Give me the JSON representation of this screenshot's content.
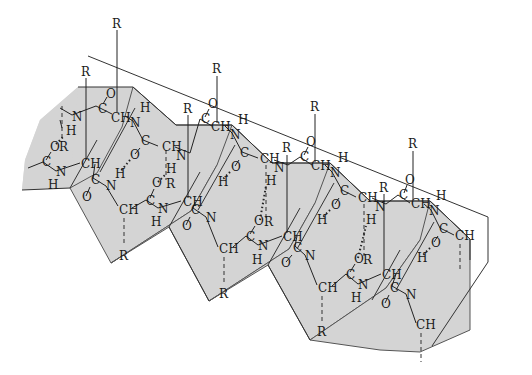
{
  "diagram": {
    "type": "beta-pleated-sheet",
    "colors": {
      "sheet_fill": "#d4d4d4",
      "line": "#333333",
      "background": "#ffffff"
    },
    "side_chains": [
      {
        "label": "R",
        "x": 117,
        "y": 25
      },
      {
        "label": "R",
        "x": 86,
        "y": 74
      },
      {
        "label": "R",
        "x": 217,
        "y": 70
      },
      {
        "label": "R",
        "x": 188,
        "y": 110
      },
      {
        "label": "R",
        "x": 315,
        "y": 108
      },
      {
        "label": "R",
        "x": 287,
        "y": 150
      },
      {
        "label": "R",
        "x": 413,
        "y": 146
      },
      {
        "label": "R",
        "x": 384,
        "y": 189
      },
      {
        "label": "R",
        "x": 124,
        "y": 258
      },
      {
        "label": "R",
        "x": 224,
        "y": 296
      },
      {
        "label": "R",
        "x": 322,
        "y": 334
      },
      {
        "label": "R",
        "x": 59,
        "y": 147
      },
      {
        "label": "R",
        "x": 167,
        "y": 185
      },
      {
        "label": "R",
        "x": 266,
        "y": 223
      },
      {
        "label": "R",
        "x": 365,
        "y": 262
      }
    ],
    "atoms": [
      {
        "label": "N",
        "x": 72,
        "y": 117
      },
      {
        "label": "C",
        "x": 100,
        "y": 109
      },
      {
        "label": "O",
        "x": 107,
        "y": 94
      },
      {
        "label": "CH",
        "x": 113,
        "y": 118
      },
      {
        "label": "H",
        "x": 141,
        "y": 110
      },
      {
        "label": "N",
        "x": 133,
        "y": 125
      },
      {
        "label": "H",
        "x": 68,
        "y": 133
      },
      {
        "label": "O",
        "x": 52,
        "y": 149
      },
      {
        "label": "C",
        "x": 44,
        "y": 164
      },
      {
        "label": "N",
        "x": 58,
        "y": 174
      },
      {
        "label": "H",
        "x": 50,
        "y": 187
      },
      {
        "label": "CH",
        "x": 83,
        "y": 166
      },
      {
        "label": "C",
        "x": 143,
        "y": 143
      },
      {
        "label": "O",
        "x": 132,
        "y": 157
      },
      {
        "label": "CH",
        "x": 163,
        "y": 149
      },
      {
        "label": "H",
        "x": 168,
        "y": 171
      },
      {
        "label": "N",
        "x": 178,
        "y": 158
      },
      {
        "label": "H",
        "x": 117,
        "y": 176
      },
      {
        "label": "C",
        "x": 93,
        "y": 182
      },
      {
        "label": "N",
        "x": 108,
        "y": 188
      },
      {
        "label": "O",
        "x": 84,
        "y": 199
      },
      {
        "label": "CH",
        "x": 120,
        "y": 212
      },
      {
        "label": "C",
        "x": 148,
        "y": 203
      },
      {
        "label": "O",
        "x": 154,
        "y": 185
      },
      {
        "label": "N",
        "x": 160,
        "y": 211
      },
      {
        "label": "H",
        "x": 153,
        "y": 224
      },
      {
        "label": "CH",
        "x": 184,
        "y": 204
      },
      {
        "label": "C",
        "x": 203,
        "y": 121
      },
      {
        "label": "O",
        "x": 210,
        "y": 106
      },
      {
        "label": "CH",
        "x": 213,
        "y": 129
      },
      {
        "label": "H",
        "x": 240,
        "y": 122
      },
      {
        "label": "N",
        "x": 232,
        "y": 137
      },
      {
        "label": "C",
        "x": 242,
        "y": 155
      },
      {
        "label": "O",
        "x": 233,
        "y": 169
      },
      {
        "label": "CH",
        "x": 262,
        "y": 161
      },
      {
        "label": "N",
        "x": 276,
        "y": 170
      },
      {
        "label": "H",
        "x": 268,
        "y": 183
      },
      {
        "label": "H",
        "x": 220,
        "y": 184
      },
      {
        "label": "C",
        "x": 193,
        "y": 212
      },
      {
        "label": "O",
        "x": 184,
        "y": 228
      },
      {
        "label": "N",
        "x": 208,
        "y": 220
      },
      {
        "label": "CH",
        "x": 221,
        "y": 251
      },
      {
        "label": "O",
        "x": 256,
        "y": 223
      },
      {
        "label": "C",
        "x": 248,
        "y": 239
      },
      {
        "label": "N",
        "x": 260,
        "y": 248
      },
      {
        "label": "H",
        "x": 254,
        "y": 262
      },
      {
        "label": "CH",
        "x": 285,
        "y": 239
      },
      {
        "label": "C",
        "x": 302,
        "y": 159
      },
      {
        "label": "O",
        "x": 308,
        "y": 144
      },
      {
        "label": "CH",
        "x": 313,
        "y": 168
      },
      {
        "label": "H",
        "x": 340,
        "y": 160
      },
      {
        "label": "N",
        "x": 332,
        "y": 175
      },
      {
        "label": "C",
        "x": 342,
        "y": 193
      },
      {
        "label": "O",
        "x": 333,
        "y": 207
      },
      {
        "label": "CH",
        "x": 360,
        "y": 200
      },
      {
        "label": "N",
        "x": 377,
        "y": 209
      },
      {
        "label": "H",
        "x": 368,
        "y": 222
      },
      {
        "label": "H",
        "x": 319,
        "y": 222
      },
      {
        "label": "C",
        "x": 295,
        "y": 250
      },
      {
        "label": "O",
        "x": 283,
        "y": 265
      },
      {
        "label": "N",
        "x": 307,
        "y": 258
      },
      {
        "label": "CH",
        "x": 320,
        "y": 290
      },
      {
        "label": "O",
        "x": 356,
        "y": 261
      },
      {
        "label": "C",
        "x": 348,
        "y": 277
      },
      {
        "label": "N",
        "x": 360,
        "y": 287
      },
      {
        "label": "H",
        "x": 353,
        "y": 300
      },
      {
        "label": "CH",
        "x": 384,
        "y": 277
      },
      {
        "label": "C",
        "x": 401,
        "y": 197
      },
      {
        "label": "O",
        "x": 407,
        "y": 182
      },
      {
        "label": "CH",
        "x": 413,
        "y": 206
      },
      {
        "label": "H",
        "x": 438,
        "y": 198
      },
      {
        "label": "N",
        "x": 431,
        "y": 213
      },
      {
        "label": "C",
        "x": 441,
        "y": 231
      },
      {
        "label": "O",
        "x": 433,
        "y": 245
      },
      {
        "label": "CH",
        "x": 457,
        "y": 238
      },
      {
        "label": "H",
        "x": 419,
        "y": 260
      },
      {
        "label": "C",
        "x": 392,
        "y": 290
      },
      {
        "label": "O",
        "x": 383,
        "y": 306
      },
      {
        "label": "N",
        "x": 408,
        "y": 297
      },
      {
        "label": "CH",
        "x": 418,
        "y": 327
      }
    ]
  }
}
